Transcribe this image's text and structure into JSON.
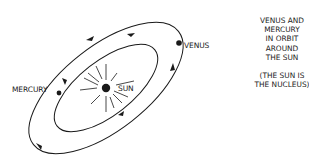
{
  "diagram": {
    "labels": {
      "sun": "SUN",
      "venus": "VENUS",
      "mercury": "MERCURY"
    },
    "caption": {
      "lines": [
        "VENUS AND",
        "MERCURY",
        "IN ORBIT",
        "AROUND",
        "THE SUN"
      ],
      "note_lines": [
        "(THE SUN IS",
        "THE NUCLEUS)"
      ]
    },
    "colors": {
      "ink": "#1a1a1a",
      "background": "#ffffff"
    }
  }
}
